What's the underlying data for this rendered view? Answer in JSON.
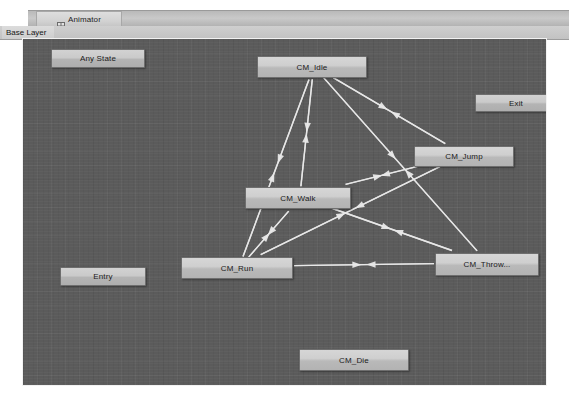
{
  "window": {
    "title": "Animator",
    "tab_icon": "animator-icon"
  },
  "layer_bar": {
    "breadcrumb": "Base Layer"
  },
  "canvas": {
    "background_color": "#5b5b5b",
    "grid_color": "#6a6a6a",
    "border_color": "#f2f2f2"
  },
  "graph": {
    "node_fill": "#cfcfcf",
    "node_border": "#6e6e6e",
    "edge_color": "#e8e8e8",
    "nodes": [
      {
        "id": "any_state",
        "label": "Any State",
        "x": 28,
        "y": 10,
        "w": 94,
        "h": 19,
        "type": "special"
      },
      {
        "id": "exit",
        "label": "Exit",
        "x": 452,
        "y": 55,
        "w": 82,
        "h": 18,
        "type": "special"
      },
      {
        "id": "entry",
        "label": "Entry",
        "x": 37,
        "y": 228,
        "w": 86,
        "h": 19,
        "type": "special"
      },
      {
        "id": "cm_idle",
        "label": "CM_Idle",
        "x": 234,
        "y": 17,
        "w": 110,
        "h": 22,
        "type": "state"
      },
      {
        "id": "cm_jump",
        "label": "CM_Jump",
        "x": 391,
        "y": 107,
        "w": 100,
        "h": 21,
        "type": "state"
      },
      {
        "id": "cm_walk",
        "label": "CM_Walk",
        "x": 222,
        "y": 148,
        "w": 106,
        "h": 22,
        "type": "state"
      },
      {
        "id": "cm_run",
        "label": "CM_Run",
        "x": 158,
        "y": 218,
        "w": 112,
        "h": 22,
        "type": "state"
      },
      {
        "id": "cm_throw",
        "label": "CM_Throw...",
        "x": 412,
        "y": 214,
        "w": 104,
        "h": 23,
        "type": "state"
      },
      {
        "id": "cm_die",
        "label": "CM_Die",
        "x": 276,
        "y": 310,
        "w": 110,
        "h": 22,
        "type": "state"
      }
    ],
    "transitions": [
      {
        "from": "cm_idle",
        "to": "cm_walk",
        "arrow_dir": "down"
      },
      {
        "from": "cm_walk",
        "to": "cm_idle",
        "arrow_dir": "up"
      },
      {
        "from": "cm_idle",
        "to": "cm_run",
        "arrow_dir": "down"
      },
      {
        "from": "cm_run",
        "to": "cm_idle",
        "arrow_dir": "up"
      },
      {
        "from": "cm_idle",
        "to": "cm_jump",
        "arrow_dir": "right"
      },
      {
        "from": "cm_jump",
        "to": "cm_idle",
        "arrow_dir": "left"
      },
      {
        "from": "cm_idle",
        "to": "cm_throw",
        "arrow_dir": "down"
      },
      {
        "from": "cm_throw",
        "to": "cm_idle",
        "arrow_dir": "up"
      },
      {
        "from": "cm_walk",
        "to": "cm_run",
        "arrow_dir": "down"
      },
      {
        "from": "cm_run",
        "to": "cm_walk",
        "arrow_dir": "up"
      },
      {
        "from": "cm_walk",
        "to": "cm_jump",
        "arrow_dir": "right"
      },
      {
        "from": "cm_jump",
        "to": "cm_walk",
        "arrow_dir": "left"
      },
      {
        "from": "cm_walk",
        "to": "cm_throw",
        "arrow_dir": "right"
      },
      {
        "from": "cm_throw",
        "to": "cm_walk",
        "arrow_dir": "left"
      },
      {
        "from": "cm_run",
        "to": "cm_jump",
        "arrow_dir": "right"
      },
      {
        "from": "cm_jump",
        "to": "cm_run",
        "arrow_dir": "left"
      },
      {
        "from": "cm_run",
        "to": "cm_throw",
        "arrow_dir": "right"
      },
      {
        "from": "cm_throw",
        "to": "cm_run",
        "arrow_dir": "left"
      }
    ]
  }
}
